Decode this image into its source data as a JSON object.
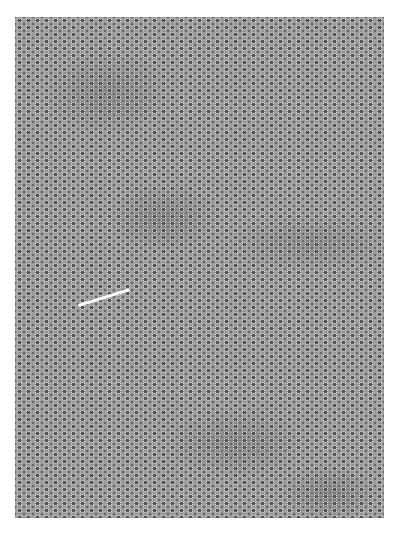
{
  "image": {
    "description": "Grayscale scanning electron micrograph of a densely packed cellular/scale-like surface texture",
    "colors": {
      "background": "#ffffff",
      "midtone": "#8e8e8e",
      "shadow": "#5a5a5a",
      "highlight": "#d8d8d8"
    }
  }
}
